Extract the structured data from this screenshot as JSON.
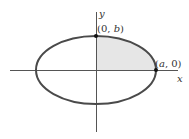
{
  "diagram": {
    "type": "ellipse-quarter-area",
    "axes": {
      "x_label": "x",
      "y_label": "y"
    },
    "points": [
      {
        "label": "(0, b)",
        "pre": "(0, ",
        "var": "b",
        "post": ")"
      },
      {
        "label": "(a, 0)",
        "pre": "(",
        "var": "a",
        "post": ", 0)"
      }
    ],
    "shaded_region": "first quadrant of ellipse",
    "colors": {
      "curve": "#4a4a4a",
      "axes": "#555555",
      "shade": "#e6e6e6",
      "point": "#111111"
    }
  }
}
